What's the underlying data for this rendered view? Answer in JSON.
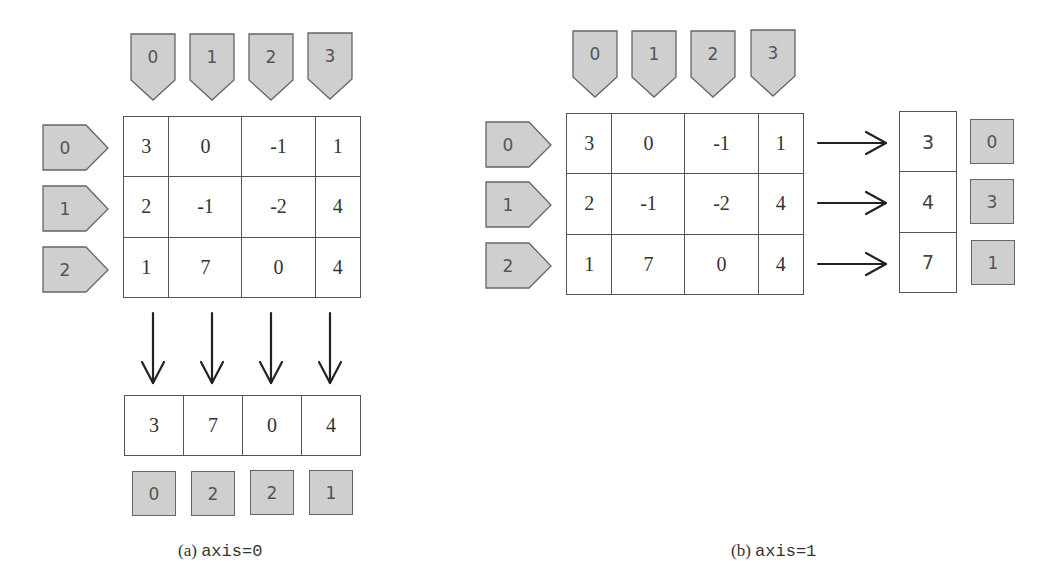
{
  "panels": [
    {
      "id": "a",
      "caption_prefix": "(a) ",
      "caption_code": "axis=0",
      "column_labels": [
        "0",
        "1",
        "2",
        "3"
      ],
      "row_labels": [
        "0",
        "1",
        "2"
      ],
      "matrix": [
        [
          "3",
          "0",
          "-1",
          "1"
        ],
        [
          "2",
          "-1",
          "-2",
          "4"
        ],
        [
          "1",
          "7",
          "0",
          "4"
        ]
      ],
      "result_values": [
        "3",
        "7",
        "0",
        "4"
      ],
      "result_indices": [
        "0",
        "2",
        "2",
        "1"
      ],
      "arrow_direction": "down"
    },
    {
      "id": "b",
      "caption_prefix": "(b) ",
      "caption_code": "axis=1",
      "column_labels": [
        "0",
        "1",
        "2",
        "3"
      ],
      "row_labels": [
        "0",
        "1",
        "2"
      ],
      "matrix": [
        [
          "3",
          "0",
          "-1",
          "1"
        ],
        [
          "2",
          "-1",
          "-2",
          "4"
        ],
        [
          "1",
          "7",
          "0",
          "4"
        ]
      ],
      "result_values": [
        "3",
        "4",
        "7"
      ],
      "result_indices": [
        "0",
        "3",
        "1"
      ],
      "arrow_direction": "right"
    }
  ],
  "colors": {
    "tag_fill": "#cfcfcf",
    "tag_stroke": "#666666",
    "grid_line": "#555555",
    "arrow": "#222222"
  }
}
